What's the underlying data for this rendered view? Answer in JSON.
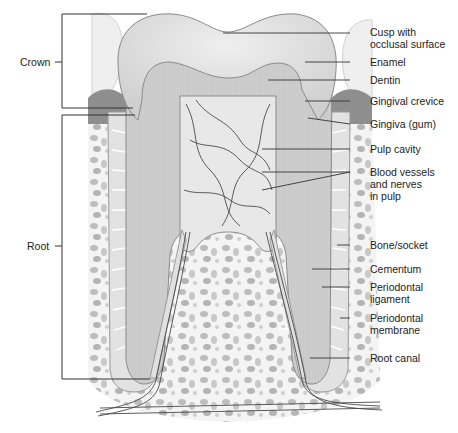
{
  "diagram": {
    "colors": {
      "line": "#333333",
      "enamel": "#dcdcdc",
      "dentin": "#c9c9c9",
      "pulp": "#e6e6e6",
      "bone": "#f2f2f2",
      "vessel": "#4a4a4a",
      "gum": "#9a9a9a"
    },
    "brackets": [
      {
        "id": "crown",
        "label": "Crown"
      },
      {
        "id": "root",
        "label": "Root"
      }
    ],
    "labels": [
      {
        "id": "cusp",
        "line1": "Cusp with",
        "line2": "occlusal surface"
      },
      {
        "id": "enamel",
        "line1": "Enamel"
      },
      {
        "id": "dentin",
        "line1": "Dentin"
      },
      {
        "id": "gingival-crevice",
        "line1": "Gingival crevice"
      },
      {
        "id": "gingiva",
        "line1": "Gingiva (gum)"
      },
      {
        "id": "pulp-cavity",
        "line1": "Pulp cavity"
      },
      {
        "id": "blood-vessels",
        "line1": "Blood vessels",
        "line2": "and nerves",
        "line3": "in pulp"
      },
      {
        "id": "bone-socket",
        "line1": "Bone/socket"
      },
      {
        "id": "cementum",
        "line1": "Cementum"
      },
      {
        "id": "periodontal-ligament",
        "line1": "Periodontal",
        "line2": "ligament"
      },
      {
        "id": "periodontal-membrane",
        "line1": "Periodontal",
        "line2": "membrane"
      },
      {
        "id": "root-canal",
        "line1": "Root canal"
      }
    ]
  }
}
